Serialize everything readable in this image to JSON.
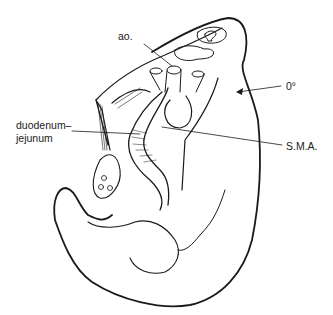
{
  "figure": {
    "labels": {
      "aorta": "ao.",
      "angle": "0°",
      "duodenum_line1": "duodenum–",
      "duodenum_line2": "jejunum",
      "sma": "S.M.A."
    },
    "colors": {
      "ink": "#1a1a1a",
      "background": "#ffffff"
    }
  }
}
